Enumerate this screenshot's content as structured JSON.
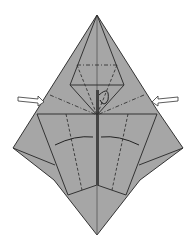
{
  "diagram": {
    "type": "origami-fold-diagram",
    "paper_color": "#a6a6a6",
    "line_color": "#333333",
    "symbols": [
      "push-arrow-left",
      "push-arrow-right",
      "valley-fold-lines",
      "mountain-fold-lines",
      "fold-arrows-center",
      "turn-loop-arrow"
    ]
  }
}
